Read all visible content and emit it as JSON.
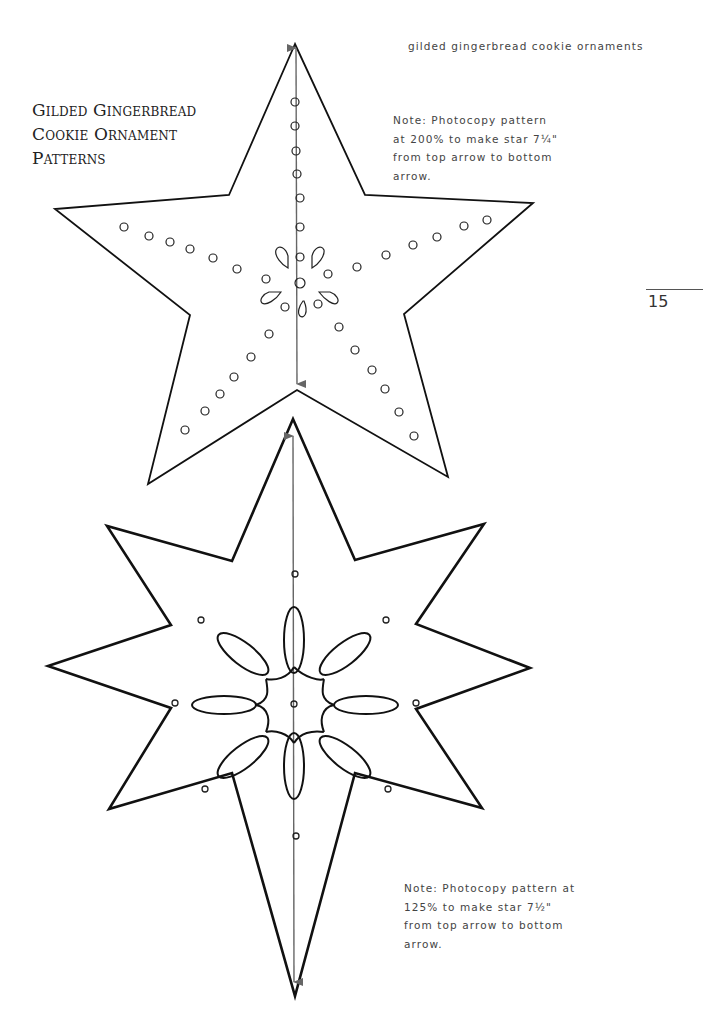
{
  "running_head": "gilded gingerbread cookie ornaments",
  "title": {
    "lines": [
      "Gilded Gingerbread",
      "Cookie Ornament",
      "Patterns"
    ]
  },
  "page_number": "15",
  "patterns": [
    {
      "name": "five-point star",
      "note_lines": [
        "Note: Photocopy pattern",
        "at 200% to make star 7¼\"",
        "from top arrow to bottom",
        "arrow."
      ]
    },
    {
      "name": "eight-point star",
      "note_lines": [
        "Note: Photocopy pattern at",
        "125% to make star 7½\"",
        "from top arrow to bottom",
        "arrow."
      ]
    }
  ],
  "colors": {
    "outline": "#111111",
    "arrow": "#666666",
    "text": "#444444"
  }
}
